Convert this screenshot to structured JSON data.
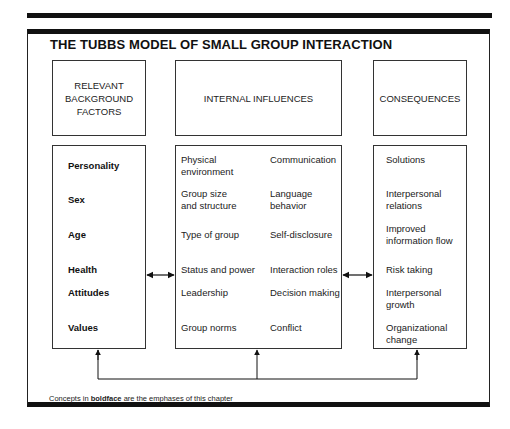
{
  "title": "THE TUBBS MODEL OF SMALL GROUP INTERACTION",
  "headers": {
    "background": "RELEVANT\nBACKGROUND\nFACTORS",
    "background_lines": [
      "RELEVANT",
      "BACKGROUND",
      "FACTORS"
    ],
    "internal": "INTERNAL INFLUENCES",
    "consequences": "CONSEQUENCES"
  },
  "background_factors": [
    {
      "label": "Personality",
      "bold": true
    },
    {
      "label": "Sex",
      "bold": true
    },
    {
      "label": "Age",
      "bold": true
    },
    {
      "label": "Health",
      "bold": true
    },
    {
      "label": "Attitudes",
      "bold": true
    },
    {
      "label": "Values",
      "bold": true
    }
  ],
  "internal_influences": {
    "left_column": [
      {
        "lines": [
          "Physical",
          "environment"
        ]
      },
      {
        "lines": [
          "Group size",
          "and structure"
        ]
      },
      {
        "lines": [
          "Type of group"
        ]
      },
      {
        "lines": [
          "Status and power"
        ]
      },
      {
        "lines": [
          "Leadership"
        ]
      },
      {
        "lines": [
          "Group norms"
        ]
      }
    ],
    "right_column": [
      {
        "lines": [
          "Communication"
        ]
      },
      {
        "lines": [
          "Language",
          "behavior"
        ]
      },
      {
        "lines": [
          "Self-disclosure"
        ]
      },
      {
        "lines": [
          "Interaction roles"
        ]
      },
      {
        "lines": [
          "Decision making"
        ]
      },
      {
        "lines": [
          "Conflict"
        ]
      }
    ]
  },
  "consequences": [
    {
      "lines": [
        "Solutions"
      ]
    },
    {
      "lines": [
        "Interpersonal",
        "relations"
      ]
    },
    {
      "lines": [
        "Improved",
        "information flow"
      ]
    },
    {
      "lines": [
        "Risk taking"
      ]
    },
    {
      "lines": [
        "Interpersonal",
        "growth"
      ]
    },
    {
      "lines": [
        "Organizational",
        "change"
      ]
    }
  ],
  "footnote": {
    "prefix": "Concepts in ",
    "bold": "boldface",
    "suffix": " are the emphases of this chapter"
  },
  "connectors": {
    "bidirectional": [
      "background-internal",
      "internal-consequences"
    ],
    "feedback_loop": "arrows from bottom line up into all three content boxes"
  }
}
